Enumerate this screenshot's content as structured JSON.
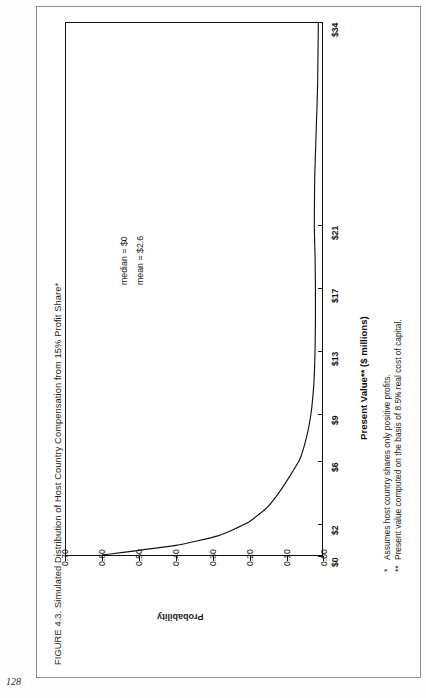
{
  "page": {
    "folio": "128"
  },
  "figure": {
    "title": "FIGURE 4.3. Simulated Distribution of Host Country Compensation from 15% Profit Share*"
  },
  "annotations": [
    {
      "text": "median = $0"
    },
    {
      "text": "mean = $2.6"
    }
  ],
  "footnotes": [
    {
      "marker": "*",
      "text": "Assumes host country shares only positive profits."
    },
    {
      "marker": "**",
      "text": "Present value computed on the basis of 8.5% real cost of capital."
    }
  ],
  "chart_data": {
    "type": "line",
    "title": "Simulated Distribution of Host Country Compensation from 15% Profit Share",
    "xlabel": "Present Value** ($ millions)",
    "ylabel": "Probability",
    "orientation": "rotated-90",
    "grid": false,
    "legend": "none",
    "xlim": [
      0,
      34
    ],
    "ylim": [
      0.0,
      0.7
    ],
    "xticklabels": [
      "$0",
      "$2",
      "$6",
      "$9",
      "$13",
      "$17",
      "$21",
      "$34"
    ],
    "xtickvalues": [
      0,
      2,
      6,
      9,
      13,
      17,
      21,
      34
    ],
    "yticklabels": [
      "0.70",
      "0.60",
      "0.50",
      "0.40",
      "0.30",
      "0.20",
      "0.10",
      "0.00"
    ],
    "ytickvalues": [
      0.7,
      0.6,
      0.5,
      0.4,
      0.3,
      0.2,
      0.1,
      0.0
    ],
    "x": [
      0,
      0.6,
      1.2,
      2.0,
      3.0,
      4.2,
      6.0,
      7.5,
      9.0,
      11.0,
      13.0,
      15.0,
      17.0,
      19.0,
      21.0,
      24.0,
      27.0,
      30.0,
      34.0
    ],
    "y": [
      0.6,
      0.4,
      0.285,
      0.205,
      0.15,
      0.11,
      0.062,
      0.042,
      0.03,
      0.022,
      0.019,
      0.018,
      0.018,
      0.019,
      0.021,
      0.02,
      0.016,
      0.012,
      0.01
    ],
    "statistics": {
      "median": "$0",
      "mean": "$2.6"
    }
  }
}
